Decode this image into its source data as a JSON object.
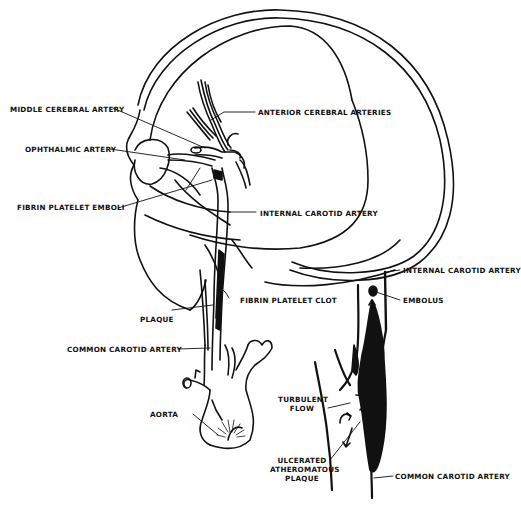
{
  "diagram": {
    "type": "medical-illustration",
    "line_color": "#111111",
    "background": "#ffffff",
    "labels": {
      "middle_cerebral_artery": "MIDDLE CEREBRAL ARTERY",
      "anterior_cerebral_arteries": "ANTERIOR CEREBRAL ARTERIES",
      "ophthalmic_artery": "OPHTHALMIC ARTERY",
      "fibrin_platelet_emboli": "FIBRIN PLATELET EMBOLI",
      "internal_carotid_artery": "INTERNAL CAROTID ARTERY",
      "fibrin_platelet_clot": "FIBRIN PLATELET CLOT",
      "plaque": "PLAQUE",
      "common_carotid_artery": "COMMON CAROTID ARTERY",
      "aorta": "AORTA",
      "inset_internal_carotid_artery": "INTERNAL CAROTID ARTERY",
      "embolus": "EMBOLUS",
      "turbulent_flow_1": "TURBULENT",
      "turbulent_flow_2": "FLOW",
      "ulcerated_1": "ULCERATED",
      "ulcerated_2": "ATHEROMATOUS",
      "ulcerated_3": "PLAQUE",
      "inset_common_carotid_artery": "COMMON CAROTID ARTERY"
    }
  }
}
